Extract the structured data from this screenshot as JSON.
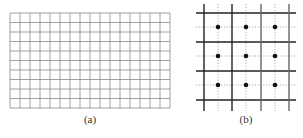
{
  "figure": {
    "panels": [
      {
        "id": "a",
        "caption": "(a)",
        "caption_pos": {
          "x": 90,
          "y": 113
        },
        "type": "uniform-grid",
        "x0": 10,
        "y0": 13,
        "x1": 170,
        "y1": 108,
        "cols": 16,
        "rows": 10,
        "line_color": "#8a8a8a",
        "line_width": 0.8
      },
      {
        "id": "b",
        "caption": "(b)",
        "caption_pos": {
          "x": 246,
          "y": 113
        },
        "type": "staggered-grid",
        "solid_vertical_x": [
          204,
          232,
          261,
          289
        ],
        "solid_vertical_colors": [
          "#222222",
          "#222222",
          "#666666",
          "#666666"
        ],
        "solid_vertical_y": [
          4,
          111
        ],
        "solid_horizontal_y": [
          13,
          42,
          71,
          100
        ],
        "solid_horizontal_x": [
          196,
          296
        ],
        "dotted_vertical_x": [
          218,
          246,
          275
        ],
        "dotted_vertical_y": [
          4,
          111
        ],
        "dotted_horizontal_y": [
          27,
          56,
          85
        ],
        "dotted_horizontal_x": [
          196,
          296
        ],
        "dot_radius": 2.3,
        "solid_color": "#222222",
        "dotted_color": "#9a9a9a",
        "dot_color": "#111111"
      }
    ]
  }
}
